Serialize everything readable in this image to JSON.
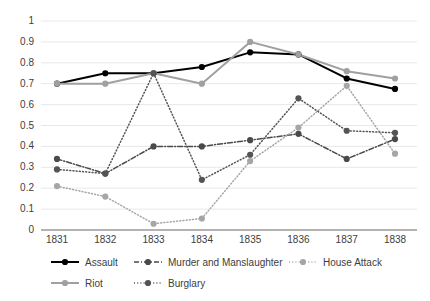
{
  "chart_data": {
    "type": "line",
    "title": "",
    "subtitle": "",
    "xlabel": "",
    "ylabel": "",
    "categories": [
      "1831",
      "1832",
      "1833",
      "1834",
      "1835",
      "1836",
      "1837",
      "1838"
    ],
    "x": [
      1831,
      1832,
      1833,
      1834,
      1835,
      1836,
      1837,
      1838
    ],
    "ylim": [
      0,
      1
    ],
    "yticks": [
      "0",
      "0.1",
      "0.2",
      "0.3",
      "0.4",
      "0.5",
      "0.6",
      "0.7",
      "0.8",
      "0.9",
      "1"
    ],
    "ytick_values": [
      0,
      0.1,
      0.2,
      0.3,
      0.4,
      0.5,
      0.6,
      0.7,
      0.8,
      0.9,
      1
    ],
    "grid": true,
    "grid_axis": "y",
    "legend_position": "bottom",
    "series": [
      {
        "name": "Assault",
        "values": [
          0.7,
          0.75,
          0.75,
          0.78,
          0.85,
          0.84,
          0.725,
          0.675
        ],
        "color": "#000000",
        "dash": "none",
        "marker": "circle"
      },
      {
        "name": "Murder and Manslaughter",
        "values": [
          0.34,
          0.27,
          0.4,
          0.4,
          0.43,
          0.46,
          0.34,
          0.435
        ],
        "color": "#4a4a4a",
        "dash": "dashdot",
        "marker": "circle"
      },
      {
        "name": "House Attack",
        "values": [
          0.21,
          0.16,
          0.03,
          0.055,
          0.33,
          0.49,
          0.69,
          0.365
        ],
        "color": "#a6a6a6",
        "dash": "dotted",
        "marker": "circle"
      },
      {
        "name": "Riot",
        "values": [
          0.7,
          0.7,
          0.75,
          0.7,
          0.9,
          0.84,
          0.76,
          0.725
        ],
        "color": "#a0a0a0",
        "dash": "none",
        "marker": "circle"
      },
      {
        "name": "Burglary",
        "values": [
          0.29,
          0.27,
          0.75,
          0.24,
          0.36,
          0.63,
          0.475,
          0.465
        ],
        "color": "#545454",
        "dash": "dotted",
        "marker": "circle"
      }
    ]
  },
  "axis": {
    "y_labels": [
      "1",
      "0.9",
      "0.8",
      "0.7",
      "0.6",
      "0.5",
      "0.4",
      "0.3",
      "0.2",
      "0.1",
      "0"
    ],
    "x_labels": [
      "1831",
      "1832",
      "1833",
      "1834",
      "1835",
      "1836",
      "1837",
      "1838"
    ]
  },
  "legend": {
    "row1": [
      {
        "label": "Assault",
        "color": "#000000",
        "dash": "none"
      },
      {
        "label": "Murder and Manslaughter",
        "color": "#4a4a4a",
        "dash": "dashdot"
      },
      {
        "label": "House Attack",
        "color": "#a6a6a6",
        "dash": "dotted"
      }
    ],
    "row2": [
      {
        "label": "Riot",
        "color": "#a0a0a0",
        "dash": "none"
      },
      {
        "label": "Burglary",
        "color": "#545454",
        "dash": "dotted"
      }
    ]
  },
  "colors": {
    "assault": "#000000",
    "murder": "#4a4a4a",
    "house_attack": "#a6a6a6",
    "riot": "#a0a0a0",
    "burglary": "#545454",
    "grid": "#e8e8e8",
    "axis": "#9a9a9a",
    "text": "#3d3d3d"
  }
}
